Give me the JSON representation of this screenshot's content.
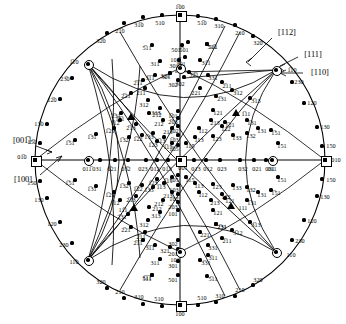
{
  "figure": {
    "type": "stereographic-projection",
    "system": "cubic",
    "center_pole": "001",
    "radius": 145,
    "center": {
      "x": 180,
      "y": 160
    }
  },
  "direction_labels": [
    {
      "text": "[112]",
      "x": 287,
      "y": 33
    },
    {
      "text": "[111]",
      "x": 313,
      "y": 55
    },
    {
      "text": "[110]",
      "x": 320,
      "y": 73
    },
    {
      "text": "[001̅]",
      "x": 22,
      "y": 141
    },
    {
      "text": "[100]",
      "x": 23,
      "y": 180
    }
  ],
  "special_poles": [
    {
      "label": "1̅00",
      "x": 180,
      "y": 15,
      "marker": "square",
      "lx": 180,
      "ly": 7
    },
    {
      "label": "100",
      "x": 180,
      "y": 305,
      "marker": "square",
      "lx": 180,
      "ly": 314
    },
    {
      "label": "01̅0",
      "x": 35,
      "y": 160,
      "marker": "square",
      "lx": 22,
      "ly": 157
    },
    {
      "label": "010",
      "x": 325,
      "y": 160,
      "marker": "square",
      "lx": 336,
      "ly": 160
    },
    {
      "label": "001",
      "x": 180,
      "y": 160,
      "marker": "square",
      "lx": 183,
      "ly": 168
    },
    {
      "label": "1̅10",
      "x": 88,
      "y": 64,
      "marker": "circle",
      "lx": 74,
      "ly": 62
    },
    {
      "label": "11̅0",
      "x": 88,
      "y": 260,
      "marker": "circle",
      "lx": 74,
      "ly": 262
    },
    {
      "label": "1̅10",
      "x": 276,
      "y": 70,
      "marker": "circle",
      "lx": 292,
      "ly": 70
    },
    {
      "label": "110",
      "x": 276,
      "y": 252,
      "marker": "circle",
      "lx": 291,
      "ly": 255
    },
    {
      "label": "011̅",
      "x": 88,
      "y": 160,
      "marker": "circle",
      "lx": 87,
      "ly": 169
    },
    {
      "label": "011",
      "x": 272,
      "y": 160,
      "marker": "circle",
      "lx": 272,
      "ly": 169
    },
    {
      "label": "101̅",
      "x": 180,
      "y": 68,
      "marker": "circle",
      "lx": 175,
      "ly": 60
    },
    {
      "label": "101",
      "x": 180,
      "y": 252,
      "marker": "circle",
      "lx": 175,
      "ly": 260
    }
  ],
  "triangles": [
    {
      "label": "111",
      "x": 231,
      "y": 206,
      "lx": 243,
      "ly": 208
    },
    {
      "label": "1̅1̅1",
      "x": 131,
      "y": 117,
      "lx": 120,
      "ly": 119
    },
    {
      "label": "1̅11",
      "x": 236,
      "y": 113,
      "lx": 246,
      "ly": 114
    },
    {
      "label": "11̅1",
      "x": 134,
      "y": 208,
      "lx": 123,
      "ly": 210
    }
  ],
  "poles": [
    {
      "l": "31̅0",
      "x": 143,
      "y": 17,
      "lx": 139,
      "ly": 25
    },
    {
      "l": "510",
      "x": 162,
      "y": 15,
      "lx": 160,
      "ly": 23
    },
    {
      "l": "51̅0",
      "x": 198,
      "y": 16,
      "lx": 202,
      "ly": 23
    },
    {
      "l": "310",
      "x": 216,
      "y": 19,
      "lx": 219,
      "ly": 26
    },
    {
      "l": "21̅0",
      "x": 124,
      "y": 23,
      "lx": 120,
      "ly": 31
    },
    {
      "l": "210",
      "x": 235,
      "y": 25,
      "lx": 240,
      "ly": 33
    },
    {
      "l": "32̅0",
      "x": 107,
      "y": 33,
      "lx": 101,
      "ly": 41
    },
    {
      "l": "320",
      "x": 253,
      "y": 36,
      "lx": 258,
      "ly": 43
    },
    {
      "l": "23̅0",
      "x": 72,
      "y": 78,
      "lx": 65,
      "ly": 79
    },
    {
      "l": "230",
      "x": 292,
      "y": 82,
      "lx": 299,
      "ly": 82
    },
    {
      "l": "12̅0",
      "x": 60,
      "y": 99,
      "lx": 52,
      "ly": 100
    },
    {
      "l": "120",
      "x": 304,
      "y": 103,
      "lx": 312,
      "ly": 103
    },
    {
      "l": "13̅0",
      "x": 47,
      "y": 124,
      "lx": 39,
      "ly": 124
    },
    {
      "l": "130",
      "x": 317,
      "y": 127,
      "lx": 325,
      "ly": 127
    },
    {
      "l": "15̅0",
      "x": 40,
      "y": 143,
      "lx": 32,
      "ly": 142
    },
    {
      "l": "150",
      "x": 322,
      "y": 146,
      "lx": 331,
      "ly": 146
    },
    {
      "l": "150",
      "x": 40,
      "y": 181,
      "lx": 32,
      "ly": 183
    },
    {
      "l": "150",
      "x": 322,
      "y": 179,
      "lx": 331,
      "ly": 180
    },
    {
      "l": "130",
      "x": 47,
      "y": 198,
      "lx": 39,
      "ly": 200
    },
    {
      "l": "130",
      "x": 317,
      "y": 196,
      "lx": 325,
      "ly": 197
    },
    {
      "l": "120",
      "x": 60,
      "y": 222,
      "lx": 52,
      "ly": 224
    },
    {
      "l": "120",
      "x": 304,
      "y": 220,
      "lx": 312,
      "ly": 221
    },
    {
      "l": "230",
      "x": 72,
      "y": 243,
      "lx": 64,
      "ly": 245
    },
    {
      "l": "230",
      "x": 292,
      "y": 240,
      "lx": 300,
      "ly": 241
    },
    {
      "l": "320",
      "x": 107,
      "y": 288,
      "lx": 101,
      "ly": 282
    },
    {
      "l": "320",
      "x": 253,
      "y": 285,
      "lx": 258,
      "ly": 280
    },
    {
      "l": "210",
      "x": 124,
      "y": 298,
      "lx": 120,
      "ly": 292
    },
    {
      "l": "210",
      "x": 235,
      "y": 296,
      "lx": 240,
      "ly": 290
    },
    {
      "l": "310",
      "x": 143,
      "y": 304,
      "lx": 139,
      "ly": 297
    },
    {
      "l": "310",
      "x": 216,
      "y": 302,
      "lx": 220,
      "ly": 296
    },
    {
      "l": "510",
      "x": 162,
      "y": 306,
      "lx": 159,
      "ly": 299
    },
    {
      "l": "510",
      "x": 198,
      "y": 305,
      "lx": 202,
      "ly": 298
    },
    {
      "l": "51̅1",
      "x": 207,
      "y": 44,
      "lx": 213,
      "ly": 47
    },
    {
      "l": "5̅11",
      "x": 152,
      "y": 45,
      "lx": 147,
      "ly": 48
    },
    {
      "l": "5̅01",
      "x": 188,
      "y": 42,
      "lx": 184,
      "ly": 50
    },
    {
      "l": "501",
      "x": 182,
      "y": 45,
      "lx": 176,
      "ly": 50
    },
    {
      "l": "31̅1",
      "x": 200,
      "y": 60,
      "lx": 206,
      "ly": 63
    },
    {
      "l": "311",
      "x": 160,
      "y": 61,
      "lx": 155,
      "ly": 64
    },
    {
      "l": "3̅01",
      "x": 185,
      "y": 57,
      "lx": 181,
      "ly": 64
    },
    {
      "l": "301",
      "x": 179,
      "y": 60,
      "lx": 174,
      "ly": 66
    },
    {
      "l": "32̅1",
      "x": 189,
      "y": 72,
      "lx": 194,
      "ly": 75
    },
    {
      "l": "321",
      "x": 170,
      "y": 73,
      "lx": 165,
      "ly": 76
    },
    {
      "l": "3̅02",
      "x": 184,
      "y": 77,
      "lx": 180,
      "ly": 84
    },
    {
      "l": "302",
      "x": 178,
      "y": 80,
      "lx": 173,
      "ly": 85
    },
    {
      "l": "3̅1̅1",
      "x": 155,
      "y": 75,
      "lx": 150,
      "ly": 78
    },
    {
      "l": "331",
      "x": 208,
      "y": 75,
      "lx": 213,
      "ly": 78
    },
    {
      "l": "2̅1̅1",
      "x": 143,
      "y": 80,
      "lx": 138,
      "ly": 83
    },
    {
      "l": "211",
      "x": 145,
      "y": 88,
      "lx": 141,
      "ly": 93
    },
    {
      "l": "2̅11",
      "x": 222,
      "y": 82,
      "lx": 227,
      "ly": 86
    },
    {
      "l": "221",
      "x": 200,
      "y": 88,
      "lx": 196,
      "ly": 93
    },
    {
      "l": "2̅21",
      "x": 131,
      "y": 93,
      "lx": 126,
      "ly": 96
    },
    {
      "l": "3̅12",
      "x": 232,
      "y": 90,
      "lx": 238,
      "ly": 93
    },
    {
      "l": "312",
      "x": 148,
      "y": 100,
      "lx": 144,
      "ly": 105
    },
    {
      "l": "2̅31",
      "x": 216,
      "y": 96,
      "lx": 222,
      "ly": 99
    },
    {
      "l": "3̅13",
      "x": 250,
      "y": 98,
      "lx": 256,
      "ly": 101
    },
    {
      "l": "313",
      "x": 160,
      "y": 108,
      "lx": 156,
      "ly": 113
    },
    {
      "l": "2̅1̅2",
      "x": 149,
      "y": 113,
      "lx": 157,
      "ly": 115
    },
    {
      "l": "212",
      "x": 163,
      "y": 120,
      "lx": 159,
      "ly": 124
    },
    {
      "l": "2̅13",
      "x": 136,
      "y": 124,
      "lx": 131,
      "ly": 128
    },
    {
      "l": "213",
      "x": 172,
      "y": 128,
      "lx": 168,
      "ly": 132
    },
    {
      "l": "1̅12",
      "x": 120,
      "y": 120,
      "lx": 115,
      "ly": 123
    },
    {
      "l": "121",
      "x": 213,
      "y": 110,
      "lx": 218,
      "ly": 113
    },
    {
      "l": "1̅21",
      "x": 225,
      "y": 122,
      "lx": 230,
      "ly": 125
    },
    {
      "l": "1̅31",
      "x": 247,
      "y": 120,
      "lx": 252,
      "ly": 123
    },
    {
      "l": "1̅51",
      "x": 271,
      "y": 130,
      "lx": 276,
      "ly": 133
    },
    {
      "l": "1̅51",
      "x": 75,
      "y": 140,
      "lx": 70,
      "ly": 143
    },
    {
      "l": "1̅31",
      "x": 96,
      "y": 134,
      "lx": 92,
      "ly": 137
    },
    {
      "l": "1̅21",
      "x": 114,
      "y": 128,
      "lx": 110,
      "ly": 131
    },
    {
      "l": "1̅32",
      "x": 129,
      "y": 137,
      "lx": 124,
      "ly": 140
    },
    {
      "l": "1̅22",
      "x": 142,
      "y": 135,
      "lx": 138,
      "ly": 139
    },
    {
      "l": "1̅33",
      "x": 153,
      "y": 133,
      "lx": 149,
      "ly": 137
    },
    {
      "l": "1̅13",
      "x": 164,
      "y": 137,
      "lx": 161,
      "ly": 141
    },
    {
      "l": "1̅23",
      "x": 157,
      "y": 141,
      "lx": 153,
      "ly": 145
    },
    {
      "l": "1̅15",
      "x": 172,
      "y": 143,
      "lx": 168,
      "ly": 147
    },
    {
      "l": "1̅03",
      "x": 178,
      "y": 135,
      "lx": 174,
      "ly": 140
    },
    {
      "l": "1̅02",
      "x": 178,
      "y": 126,
      "lx": 174,
      "ly": 131
    },
    {
      "l": "1̅05",
      "x": 178,
      "y": 145,
      "lx": 174,
      "ly": 149
    },
    {
      "l": "2̅03",
      "x": 178,
      "y": 118,
      "lx": 173,
      "ly": 122
    },
    {
      "l": "1̅01",
      "x": 178,
      "y": 111,
      "lx": 173,
      "ly": 116
    },
    {
      "l": "113",
      "x": 195,
      "y": 137,
      "lx": 199,
      "ly": 140
    },
    {
      "l": "123",
      "x": 213,
      "y": 136,
      "lx": 217,
      "ly": 139
    },
    {
      "l": "133",
      "x": 233,
      "y": 135,
      "lx": 237,
      "ly": 138
    },
    {
      "l": "112",
      "x": 199,
      "y": 128,
      "lx": 203,
      "ly": 131
    },
    {
      "l": "122",
      "x": 222,
      "y": 126,
      "lx": 226,
      "ly": 129
    },
    {
      "l": "132",
      "x": 247,
      "y": 133,
      "lx": 251,
      "ly": 136
    },
    {
      "l": "115",
      "x": 186,
      "y": 143,
      "lx": 190,
      "ly": 146
    },
    {
      "l": "213",
      "x": 211,
      "y": 120,
      "lx": 215,
      "ly": 123
    },
    {
      "l": "131",
      "x": 258,
      "y": 128,
      "lx": 262,
      "ly": 131
    },
    {
      "l": "151",
      "x": 278,
      "y": 143,
      "lx": 282,
      "ly": 146
    },
    {
      "l": "031",
      "x": 100,
      "y": 160,
      "lx": 97,
      "ly": 169
    },
    {
      "l": "0̅21",
      "x": 115,
      "y": 160,
      "lx": 112,
      "ly": 169
    },
    {
      "l": "03̅2",
      "x": 128,
      "y": 160,
      "lx": 126,
      "ly": 169
    },
    {
      "l": "023",
      "x": 146,
      "y": 160,
      "lx": 143,
      "ly": 169
    },
    {
      "l": "012",
      "x": 157,
      "y": 160,
      "lx": 155,
      "ly": 169
    },
    {
      "l": "01̅3",
      "x": 168,
      "y": 160,
      "lx": 167,
      "ly": 169
    },
    {
      "l": "013",
      "x": 194,
      "y": 160,
      "lx": 196,
      "ly": 169
    },
    {
      "l": "012",
      "x": 206,
      "y": 160,
      "lx": 208,
      "ly": 169
    },
    {
      "l": "023",
      "x": 220,
      "y": 160,
      "lx": 222,
      "ly": 169
    },
    {
      "l": "032",
      "x": 240,
      "y": 160,
      "lx": 243,
      "ly": 169
    },
    {
      "l": "021",
      "x": 254,
      "y": 160,
      "lx": 257,
      "ly": 169
    },
    {
      "l": "031",
      "x": 266,
      "y": 160,
      "lx": 270,
      "ly": 169
    },
    {
      "l": "115",
      "x": 186,
      "y": 177,
      "lx": 190,
      "ly": 180
    },
    {
      "l": "105",
      "x": 178,
      "y": 175,
      "lx": 174,
      "ly": 180
    },
    {
      "l": "103",
      "x": 178,
      "y": 185,
      "lx": 174,
      "ly": 190
    },
    {
      "l": "102",
      "x": 178,
      "y": 194,
      "lx": 174,
      "ly": 199
    },
    {
      "l": "203",
      "x": 178,
      "y": 202,
      "lx": 173,
      "ly": 207
    },
    {
      "l": "101",
      "x": 178,
      "y": 210,
      "lx": 173,
      "ly": 214
    },
    {
      "l": "302",
      "x": 178,
      "y": 240,
      "lx": 173,
      "ly": 244
    },
    {
      "l": "201",
      "x": 178,
      "y": 249,
      "lx": 173,
      "ly": 254
    },
    {
      "l": "301",
      "x": 178,
      "y": 261,
      "lx": 173,
      "ly": 266
    },
    {
      "l": "501",
      "x": 178,
      "y": 275,
      "lx": 173,
      "ly": 280
    },
    {
      "l": "113",
      "x": 195,
      "y": 183,
      "lx": 199,
      "ly": 186
    },
    {
      "l": "123",
      "x": 213,
      "y": 184,
      "lx": 217,
      "ly": 187
    },
    {
      "l": "133",
      "x": 233,
      "y": 185,
      "lx": 237,
      "ly": 188
    },
    {
      "l": "112",
      "x": 199,
      "y": 192,
      "lx": 203,
      "ly": 195
    },
    {
      "l": "122",
      "x": 222,
      "y": 194,
      "lx": 226,
      "ly": 197
    },
    {
      "l": "132",
      "x": 247,
      "y": 187,
      "lx": 251,
      "ly": 190
    },
    {
      "l": "213",
      "x": 211,
      "y": 200,
      "lx": 215,
      "ly": 203
    },
    {
      "l": "121",
      "x": 213,
      "y": 210,
      "lx": 218,
      "ly": 213
    },
    {
      "l": "131",
      "x": 258,
      "y": 192,
      "lx": 262,
      "ly": 195
    },
    {
      "l": "151",
      "x": 278,
      "y": 177,
      "lx": 282,
      "ly": 180
    },
    {
      "l": "231",
      "x": 216,
      "y": 224,
      "lx": 222,
      "ly": 227
    },
    {
      "l": "221",
      "x": 200,
      "y": 232,
      "lx": 205,
      "ly": 235
    },
    {
      "l": "331",
      "x": 208,
      "y": 245,
      "lx": 213,
      "ly": 248
    },
    {
      "l": "211",
      "x": 145,
      "y": 232,
      "lx": 141,
      "ly": 237
    },
    {
      "l": "321",
      "x": 170,
      "y": 247,
      "lx": 165,
      "ly": 251
    },
    {
      "l": "311",
      "x": 160,
      "y": 259,
      "lx": 155,
      "ly": 263
    },
    {
      "l": "511",
      "x": 152,
      "y": 275,
      "lx": 147,
      "ly": 279
    },
    {
      "l": "312",
      "x": 148,
      "y": 220,
      "lx": 144,
      "ly": 225
    },
    {
      "l": "313",
      "x": 160,
      "y": 212,
      "lx": 156,
      "ly": 216
    },
    {
      "l": "212",
      "x": 163,
      "y": 200,
      "lx": 159,
      "ly": 204
    },
    {
      "l": "213",
      "x": 172,
      "y": 192,
      "lx": 168,
      "ly": 196
    },
    {
      "l": "2̅12",
      "x": 149,
      "y": 207,
      "lx": 157,
      "ly": 209
    },
    {
      "l": "2̅13",
      "x": 136,
      "y": 196,
      "lx": 131,
      "ly": 200
    },
    {
      "l": "1̅12",
      "x": 120,
      "y": 200,
      "lx": 115,
      "ly": 203
    },
    {
      "l": "3̅13",
      "x": 250,
      "y": 222,
      "lx": 256,
      "ly": 225
    },
    {
      "l": "3̅12",
      "x": 232,
      "y": 230,
      "lx": 238,
      "ly": 233
    },
    {
      "l": "2̅21",
      "x": 131,
      "y": 227,
      "lx": 126,
      "ly": 230
    },
    {
      "l": "2̅11",
      "x": 222,
      "y": 238,
      "lx": 227,
      "ly": 241
    },
    {
      "l": "2̅1̅1",
      "x": 143,
      "y": 240,
      "lx": 138,
      "ly": 243
    },
    {
      "l": "3̅1̅1",
      "x": 155,
      "y": 245,
      "lx": 150,
      "ly": 248
    },
    {
      "l": "3̅11",
      "x": 208,
      "y": 255,
      "lx": 213,
      "ly": 258
    },
    {
      "l": "2̅31",
      "x": 216,
      "y": 224,
      "lx": 222,
      "ly": 227
    },
    {
      "l": "5̅1̅1",
      "x": 152,
      "y": 275,
      "lx": 147,
      "ly": 278
    },
    {
      "l": "5̅11",
      "x": 207,
      "y": 276,
      "lx": 213,
      "ly": 279
    },
    {
      "l": "3̅31",
      "x": 200,
      "y": 260,
      "lx": 206,
      "ly": 263
    },
    {
      "l": "1̅31",
      "x": 247,
      "y": 200,
      "lx": 252,
      "ly": 203
    },
    {
      "l": "1̅21",
      "x": 225,
      "y": 198,
      "lx": 230,
      "ly": 201
    },
    {
      "l": "1̅51",
      "x": 271,
      "y": 190,
      "lx": 276,
      "ly": 193
    },
    {
      "l": "1̅51",
      "x": 75,
      "y": 180,
      "lx": 70,
      "ly": 183
    },
    {
      "l": "1̅31",
      "x": 96,
      "y": 186,
      "lx": 92,
      "ly": 189
    },
    {
      "l": "1̅21",
      "x": 114,
      "y": 192,
      "lx": 110,
      "ly": 195
    },
    {
      "l": "1̅32",
      "x": 129,
      "y": 183,
      "lx": 124,
      "ly": 186
    },
    {
      "l": "1̅22",
      "x": 142,
      "y": 185,
      "lx": 138,
      "ly": 189
    },
    {
      "l": "1̅33",
      "x": 153,
      "y": 187,
      "lx": 149,
      "ly": 190
    },
    {
      "l": "1̅13",
      "x": 164,
      "y": 183,
      "lx": 161,
      "ly": 187
    },
    {
      "l": "1̅23",
      "x": 157,
      "y": 179,
      "lx": 153,
      "ly": 183
    },
    {
      "l": "1̅15",
      "x": 172,
      "y": 177,
      "lx": 168,
      "ly": 181
    },
    {
      "l": "2̅31",
      "x": 128,
      "y": 214,
      "lx": 122,
      "ly": 217
    },
    {
      "l": "2̅31",
      "x": 121,
      "y": 113,
      "lx": 116,
      "ly": 116
    },
    {
      "l": "321",
      "x": 170,
      "y": 73,
      "lx": 166,
      "ly": 77
    },
    {
      "l": "511",
      "x": 207,
      "y": 44,
      "lx": 212,
      "ly": 47
    }
  ]
}
